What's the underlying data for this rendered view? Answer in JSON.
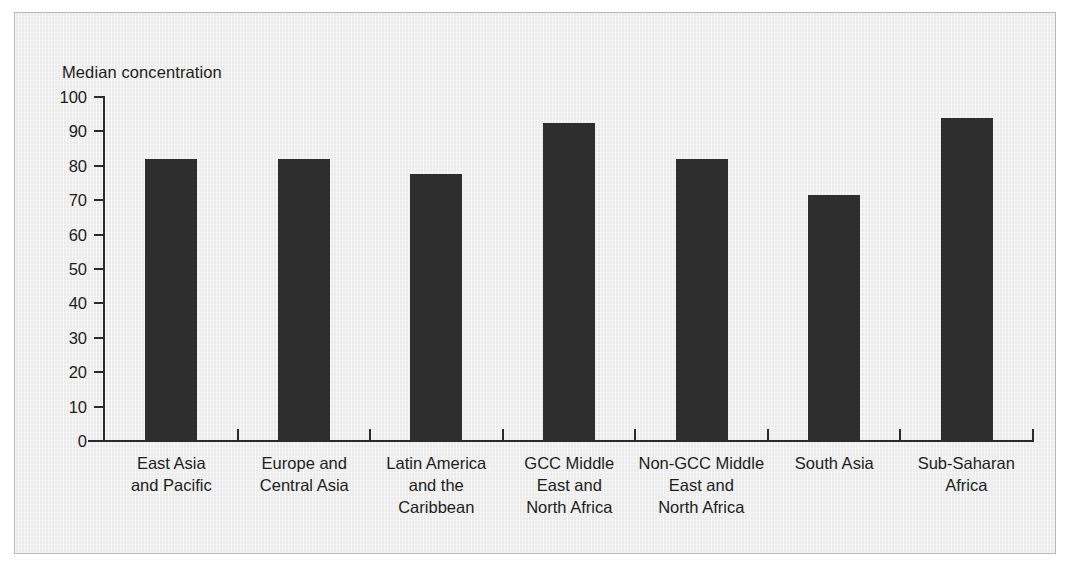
{
  "figure": {
    "background_color": "#ebebeb",
    "border_color": "#b9b9b9",
    "bar_color": "#2e2e2e",
    "axis_color": "#2b2b2b",
    "text_color": "#1d1d1d"
  },
  "chart_data": {
    "type": "bar",
    "title": "",
    "xlabel": "",
    "ylabel": "Median concentration",
    "ylim": [
      0,
      100
    ],
    "yticks": [
      0,
      10,
      20,
      30,
      40,
      50,
      60,
      70,
      80,
      90,
      100
    ],
    "grid": false,
    "legend": null,
    "categories": [
      "East Asia\nand Pacific",
      "Europe and\nCentral Asia",
      "Latin America\nand the\nCaribbean",
      "GCC Middle\nEast and\nNorth Africa",
      "Non-GCC Middle\nEast and\nNorth Africa",
      "South Asia",
      "Sub-Saharan\nAfrica"
    ],
    "category_lines": [
      [
        "East Asia",
        "and Pacific"
      ],
      [
        "Europe and",
        "Central Asia"
      ],
      [
        "Latin America",
        "and the",
        "Caribbean"
      ],
      [
        "GCC Middle",
        "East and",
        "North Africa"
      ],
      [
        "Non-GCC Middle",
        "East and",
        "North Africa"
      ],
      [
        "South Asia"
      ],
      [
        "Sub-Saharan",
        "Africa"
      ]
    ],
    "values": [
      82,
      82,
      77.5,
      92.5,
      82,
      71.5,
      94
    ]
  }
}
